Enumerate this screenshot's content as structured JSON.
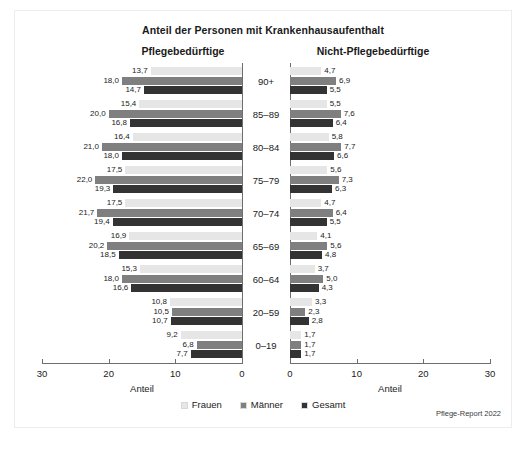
{
  "card": {
    "title": "Anteil der Personen mit Krankenhausaufenthalt",
    "panel_left": "Pflegebedürftige",
    "panel_right": "Nicht-Pflegebedürftige",
    "source": "Pflege-Report 2022"
  },
  "legend": {
    "items": [
      {
        "label": "Frauen",
        "color": "#e6e6e6"
      },
      {
        "label": "Männer",
        "color": "#7f7f7f"
      },
      {
        "label": "Gesamt",
        "color": "#333333"
      }
    ]
  },
  "axis": {
    "left_label": "Anteil",
    "right_label": "Anteil",
    "ticks_left": [
      "30",
      "20",
      "10",
      "0"
    ],
    "ticks_right": [
      "0",
      "10",
      "20",
      "30"
    ],
    "max": 30
  },
  "chart_data": {
    "type": "bar",
    "title": "Anteil der Personen mit Krankenhausaufenthalt",
    "xlabel": "Anteil",
    "ylabel": "",
    "orientation": "horizontal",
    "layout": "back-to-back pyramid, left axis reversed",
    "xlim": [
      0,
      30
    ],
    "grid": false,
    "legend_position": "bottom-center",
    "categories": [
      "90+",
      "85–89",
      "80–84",
      "75–79",
      "70–74",
      "65–69",
      "60–64",
      "20–59",
      "0–19"
    ],
    "panels": [
      {
        "name": "Pflegebedürftige",
        "side": "left",
        "series": [
          {
            "name": "Frauen",
            "color": "#e6e6e6",
            "values": [
              13.7,
              15.4,
              16.4,
              17.5,
              17.5,
              16.9,
              15.3,
              10.8,
              9.2
            ],
            "labels": [
              "13,7",
              "15,4",
              "16,4",
              "17,5",
              "17,5",
              "16,9",
              "15,3",
              "10,8",
              "9,2"
            ]
          },
          {
            "name": "Männer",
            "color": "#7f7f7f",
            "values": [
              18.0,
              20.0,
              21.0,
              22.0,
              21.7,
              20.2,
              18.0,
              10.5,
              6.8
            ],
            "labels": [
              "18,0",
              "20,0",
              "21,0",
              "22,0",
              "21,7",
              "20,2",
              "18,0",
              "10,5",
              "6,8"
            ]
          },
          {
            "name": "Gesamt",
            "color": "#333333",
            "values": [
              14.7,
              16.8,
              18.0,
              19.3,
              19.4,
              18.5,
              16.6,
              10.7,
              7.7
            ],
            "labels": [
              "14,7",
              "16,8",
              "18,0",
              "19,3",
              "19,4",
              "18,5",
              "16,6",
              "10,7",
              "7,7"
            ]
          }
        ]
      },
      {
        "name": "Nicht-Pflegebedürftige",
        "side": "right",
        "series": [
          {
            "name": "Frauen",
            "color": "#e6e6e6",
            "values": [
              4.7,
              5.5,
              5.8,
              5.6,
              4.7,
              4.1,
              3.7,
              3.3,
              1.7
            ],
            "labels": [
              "4,7",
              "5,5",
              "5,8",
              "5,6",
              "4,7",
              "4,1",
              "3,7",
              "3,3",
              "1,7"
            ]
          },
          {
            "name": "Männer",
            "color": "#7f7f7f",
            "values": [
              6.9,
              7.6,
              7.7,
              7.3,
              6.4,
              5.6,
              5.0,
              2.3,
              1.7
            ],
            "labels": [
              "6,9",
              "7,6",
              "7,7",
              "7,3",
              "6,4",
              "5,6",
              "5,0",
              "2,3",
              "1,7"
            ]
          },
          {
            "name": "Gesamt",
            "color": "#333333",
            "values": [
              5.5,
              6.4,
              6.6,
              6.3,
              5.5,
              4.8,
              4.3,
              2.8,
              1.7
            ],
            "labels": [
              "5,5",
              "6,4",
              "6,6",
              "6,3",
              "5,5",
              "4,8",
              "4,3",
              "2,8",
              "1,7"
            ]
          }
        ]
      }
    ]
  }
}
